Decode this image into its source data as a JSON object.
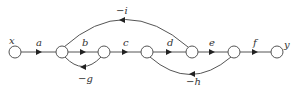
{
  "diagram": {
    "type": "signal-flow-graph",
    "input_label": "x",
    "output_label": "y",
    "forward_gains": [
      "a",
      "b",
      "c",
      "d",
      "e",
      "f"
    ],
    "feedback": [
      {
        "label": "−g",
        "from": "n2",
        "to": "n1"
      },
      {
        "label": "−h",
        "from": "n5",
        "to": "n3"
      },
      {
        "label": "−i",
        "from": "n4",
        "to": "n1"
      }
    ]
  }
}
